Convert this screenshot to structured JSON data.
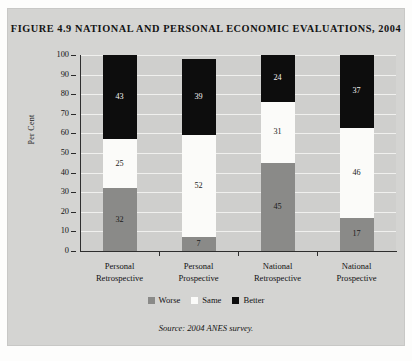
{
  "figure": {
    "title": "FIGURE 4.9 NATIONAL AND PERSONAL ECONOMIC EVALUATIONS, 2004",
    "source_note": "Source: 2004 ANES survey."
  },
  "chart_data": {
    "type": "bar",
    "subtype": "stacked-percentage",
    "title": "FIGURE 4.9 NATIONAL AND PERSONAL ECONOMIC EVALUATIONS, 2004",
    "xlabel": "",
    "ylabel": "Per Cent",
    "ylim": [
      0,
      100
    ],
    "yticks": [
      0,
      10,
      20,
      30,
      40,
      50,
      60,
      70,
      80,
      90,
      100
    ],
    "ytick_labels": [
      "0",
      "10",
      "20",
      "30",
      "40",
      "50",
      "60",
      "70",
      "80",
      "90",
      "100"
    ],
    "grid": "horizontal",
    "legend_position": "bottom-center",
    "categories": [
      "Personal Retrospective",
      "Personal Prospective",
      "National Retrospective",
      "National Prospective"
    ],
    "category_lines": [
      [
        "Personal",
        "Retrospective"
      ],
      [
        "Personal",
        "Prospective"
      ],
      [
        "National",
        "Retrospective"
      ],
      [
        "National",
        "Prospective"
      ]
    ],
    "series": [
      {
        "name": "Worse",
        "color": "#8a8a88",
        "values": [
          32,
          7,
          45,
          17
        ]
      },
      {
        "name": "Same",
        "color": "#fbfbf9",
        "values": [
          25,
          52,
          31,
          46
        ]
      },
      {
        "name": "Better",
        "color": "#0d0d0d",
        "values": [
          43,
          39,
          24,
          37
        ]
      }
    ],
    "legend": [
      {
        "label": "Worse",
        "color": "#8a8a88"
      },
      {
        "label": "Same",
        "color": "#fbfbf9"
      },
      {
        "label": "Better",
        "color": "#0d0d0d"
      }
    ],
    "annotations": "Segment values are printed inside each bar segment."
  },
  "colors": {
    "card_background": "#d4d4d2",
    "plot_background": "#cfcfcd",
    "gridline": "#f0f0ee",
    "axis": "#2e2e2e",
    "text": "#121212"
  }
}
